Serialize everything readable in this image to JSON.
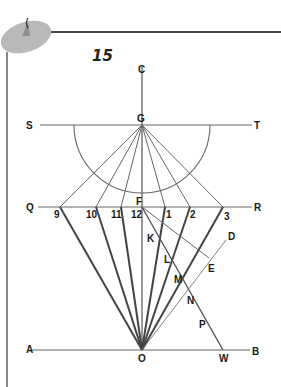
{
  "figure": {
    "number": "15",
    "colors": {
      "line": "#555555",
      "thick_line": "#444444",
      "frame": "#444444",
      "pin": "#b8b8b8",
      "label": "#1a1a1a"
    }
  },
  "labels": {
    "C": "C",
    "G": "G",
    "S": "S",
    "T": "T",
    "Q": "Q",
    "R": "R",
    "F": "F",
    "A": "A",
    "B": "B",
    "O": "O",
    "W": "W",
    "D": "D",
    "E": "E",
    "K": "K",
    "L": "L",
    "M": "M",
    "N": "N",
    "P": "P"
  },
  "hour_marks": {
    "h9": "9",
    "h10": "10",
    "h11": "11",
    "h12": "12",
    "h1": "1",
    "h2": "2",
    "h3": "3"
  }
}
